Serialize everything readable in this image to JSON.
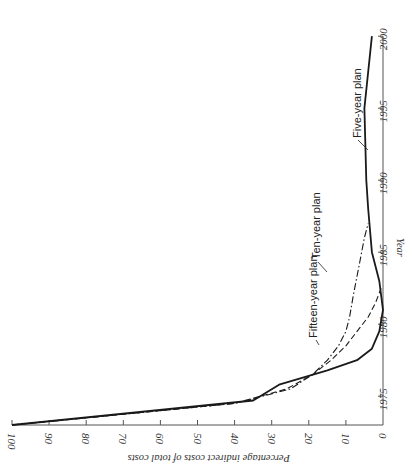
{
  "chart_data": {
    "type": "line",
    "orientation": "rotated-90-clockwise (x-axis runs vertically along right edge, y-axis runs horizontally along bottom, reversed)",
    "title": "",
    "xlabel": "Year",
    "ylabel": "Percentage indirect costs of total costs",
    "xlim": [
      1973,
      2000
    ],
    "ylim": [
      0,
      100
    ],
    "x_ticks": [
      1975,
      1980,
      1985,
      1990,
      1995,
      2000
    ],
    "x_tick_labels": [
      "1975",
      "1980",
      "1985",
      "1990",
      "1995",
      "2000"
    ],
    "y_ticks": [
      0,
      10,
      20,
      30,
      40,
      50,
      60,
      70,
      80,
      90,
      100
    ],
    "y_tick_labels": [
      "0",
      "10",
      "20",
      "30",
      "40",
      "50",
      "60",
      "70",
      "80",
      "90",
      "100"
    ],
    "grid": false,
    "legend": "inline labels with leader lines",
    "series": [
      {
        "name": "Five-year plan",
        "style": "solid",
        "x": [
          1973,
          1974.7,
          1975.8,
          1976.8,
          1977.5,
          1978.3,
          1979.5,
          1981,
          1983,
          1985,
          1988,
          1990,
          1995,
          2000
        ],
        "values": [
          100,
          35,
          28,
          15,
          7,
          3,
          1,
          0,
          1,
          3,
          4,
          4.5,
          5,
          3
        ]
      },
      {
        "name": "Ten-year plan",
        "style": "dash-dot",
        "x": [
          1973,
          1974.5,
          1975.5,
          1976.5,
          1977.5,
          1978.5,
          1979.5,
          1980.5,
          1982,
          1984,
          1986,
          1987
        ],
        "values": [
          100,
          40,
          25,
          19,
          15,
          12,
          10,
          9,
          8,
          6.5,
          5,
          4
        ]
      },
      {
        "name": "Fifteen-year plan",
        "style": "dashed",
        "x": [
          1973,
          1974.5,
          1975.5,
          1976.5,
          1977.5,
          1978.5,
          1979.5,
          1980.5,
          1981.5,
          1982.5
        ],
        "values": [
          100,
          40,
          26,
          19,
          14,
          10,
          7,
          4,
          2,
          0.5
        ]
      }
    ],
    "annotations": [
      "Five-year plan",
      "Ten-year plan",
      "Fifteen-year plan"
    ]
  },
  "labels": {
    "five_year": "Five-year plan",
    "ten_year": "Ten-year plan",
    "fifteen_year": "Fifteen-year plan",
    "x_axis_title": "Year",
    "y_axis_title": "Percentage indirect costs of total costs"
  },
  "colors": {
    "ink": "#1a1a1a",
    "axis": "#555555",
    "background": "#ffffff"
  }
}
